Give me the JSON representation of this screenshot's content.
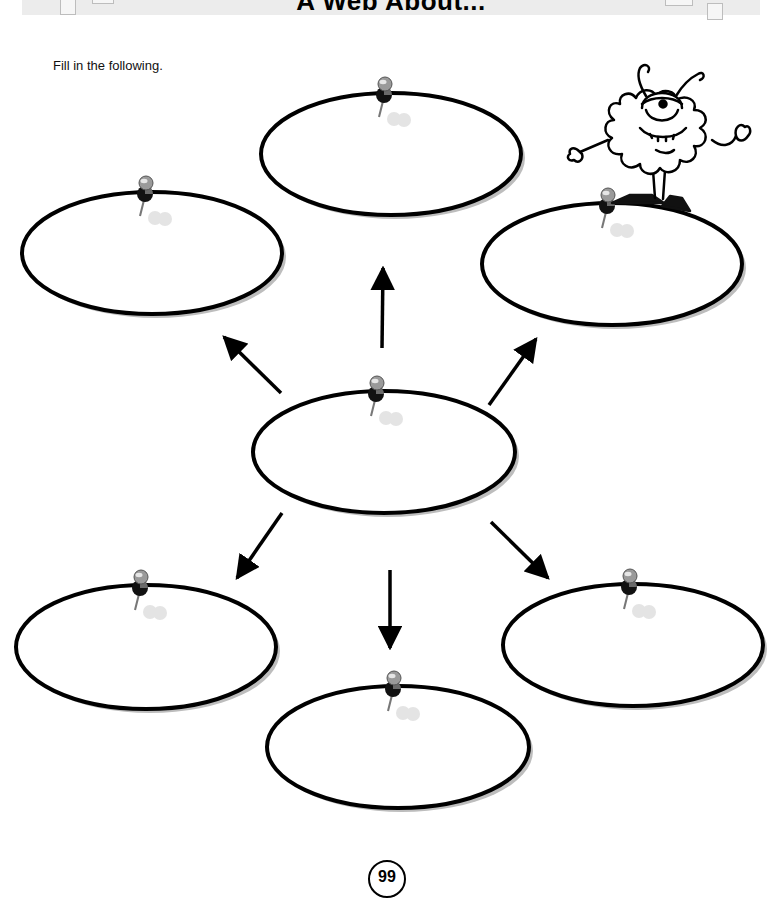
{
  "worksheet": {
    "title": "A Web About...",
    "instructions": "Fill in the following.",
    "page_number": "99",
    "colors": {
      "banner": "#ececec",
      "outline": "#000000",
      "shadow": "#bdbdbd",
      "pin_head": "#9a9a9a",
      "pin_shadow": "#d6d6d6"
    }
  },
  "web": {
    "center": {
      "id": "center",
      "label": "",
      "cx": 384,
      "cy": 452
    },
    "bubbles": [
      {
        "id": "top",
        "label": "",
        "cx": 391,
        "cy": 154,
        "pin_x": 384
      },
      {
        "id": "top-left",
        "label": "",
        "cx": 152,
        "cy": 253,
        "pin_x": 145
      },
      {
        "id": "top-right",
        "label": "",
        "cx": 612,
        "cy": 264,
        "pin_x": 607
      },
      {
        "id": "bottom-left",
        "label": "",
        "cx": 146,
        "cy": 647,
        "pin_x": 140
      },
      {
        "id": "bottom-center",
        "label": "",
        "cx": 398,
        "cy": 747,
        "pin_x": 393
      },
      {
        "id": "bottom-right",
        "label": "",
        "cx": 633,
        "cy": 645,
        "pin_x": 629
      }
    ],
    "arrows": [
      {
        "to": "top",
        "from_xy": [
          382,
          348
        ],
        "to_xy": [
          383,
          266
        ]
      },
      {
        "to": "top-left",
        "from_xy": [
          281,
          393
        ],
        "to_xy": [
          222,
          335
        ]
      },
      {
        "to": "top-right",
        "from_xy": [
          489,
          405
        ],
        "to_xy": [
          537,
          337
        ]
      },
      {
        "to": "bottom-left",
        "from_xy": [
          282,
          513
        ],
        "to_xy": [
          236,
          580
        ]
      },
      {
        "to": "bottom-center",
        "from_xy": [
          390,
          570
        ],
        "to_xy": [
          390,
          650
        ]
      },
      {
        "to": "bottom-right",
        "from_xy": [
          491,
          522
        ],
        "to_xy": [
          550,
          580
        ]
      }
    ]
  },
  "illustration": {
    "name": "one-eyed fuzzy monster mascot"
  }
}
